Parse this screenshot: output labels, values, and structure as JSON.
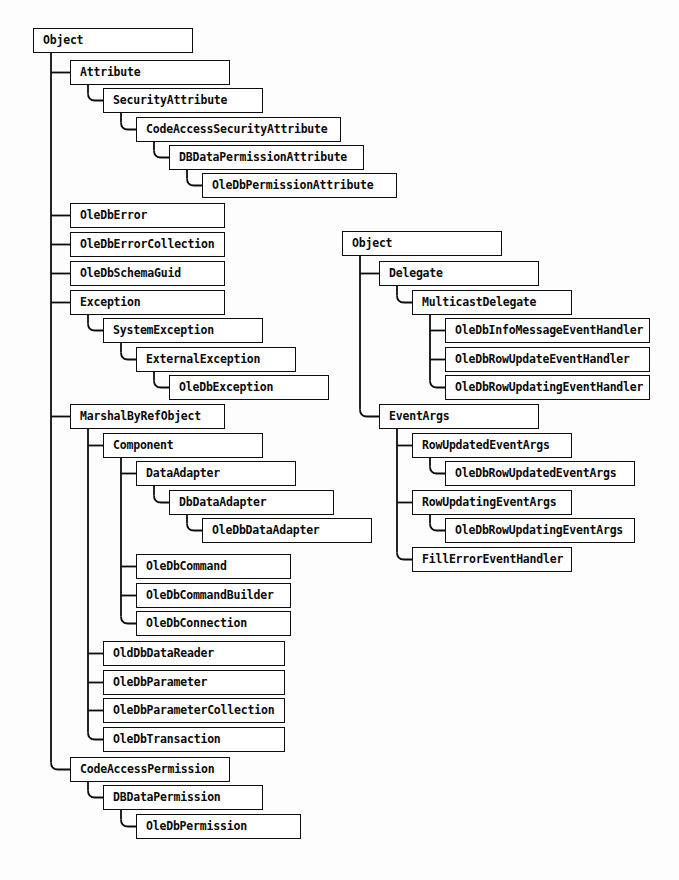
{
  "diagram": {
    "type": "class-hierarchy-tree",
    "background_color": "#fdfdfd",
    "box_border_color": "#0d0d0d",
    "box_fill_color": "#ffffff",
    "line_color": "#0d0d0d",
    "trees": [
      {
        "name": "object-tree-left",
        "root": "Object",
        "nodes": [
          {
            "id": "n0",
            "label": "Object",
            "level": 0,
            "x": 33,
            "y": 28,
            "w": 160,
            "parent": null
          },
          {
            "id": "n1",
            "label": "Attribute",
            "level": 1,
            "x": 70,
            "y": 60,
            "w": 160,
            "parent": "n0"
          },
          {
            "id": "n2",
            "label": "SecurityAttribute",
            "level": 2,
            "x": 103,
            "y": 88,
            "w": 160,
            "parent": "n1"
          },
          {
            "id": "n3",
            "label": "CodeAccessSecurityAttribute",
            "level": 3,
            "x": 136,
            "y": 117,
            "w": 205,
            "parent": "n2"
          },
          {
            "id": "n4",
            "label": "DBDataPermissionAttribute",
            "level": 4,
            "x": 169,
            "y": 145,
            "w": 195,
            "parent": "n3"
          },
          {
            "id": "n5",
            "label": "OleDbPermissionAttribute",
            "level": 5,
            "x": 202,
            "y": 173,
            "w": 195,
            "parent": "n4"
          },
          {
            "id": "n6",
            "label": "OleDbError",
            "level": 1,
            "x": 70,
            "y": 203,
            "w": 155,
            "parent": "n0"
          },
          {
            "id": "n7",
            "label": "OleDbErrorCollection",
            "level": 1,
            "x": 70,
            "y": 232,
            "w": 155,
            "parent": "n0"
          },
          {
            "id": "n8",
            "label": "OleDbSchemaGuid",
            "level": 1,
            "x": 70,
            "y": 261,
            "w": 155,
            "parent": "n0"
          },
          {
            "id": "n9",
            "label": "Exception",
            "level": 1,
            "x": 70,
            "y": 290,
            "w": 155,
            "parent": "n0"
          },
          {
            "id": "n10",
            "label": "SystemException",
            "level": 2,
            "x": 103,
            "y": 318,
            "w": 160,
            "parent": "n9"
          },
          {
            "id": "n11",
            "label": "ExternalException",
            "level": 3,
            "x": 136,
            "y": 347,
            "w": 160,
            "parent": "n10"
          },
          {
            "id": "n12",
            "label": "OleDbException",
            "level": 4,
            "x": 169,
            "y": 375,
            "w": 160,
            "parent": "n11"
          },
          {
            "id": "n13",
            "label": "MarshalByRefObject",
            "level": 1,
            "x": 70,
            "y": 404,
            "w": 155,
            "parent": "n0"
          },
          {
            "id": "n14",
            "label": "Component",
            "level": 2,
            "x": 103,
            "y": 433,
            "w": 160,
            "parent": "n13"
          },
          {
            "id": "n15",
            "label": "DataAdapter",
            "level": 3,
            "x": 136,
            "y": 461,
            "w": 160,
            "parent": "n14"
          },
          {
            "id": "n16",
            "label": "DbDataAdapter",
            "level": 4,
            "x": 169,
            "y": 490,
            "w": 165,
            "parent": "n15"
          },
          {
            "id": "n17",
            "label": "OleDbDataAdapter",
            "level": 5,
            "x": 202,
            "y": 518,
            "w": 170,
            "parent": "n16"
          },
          {
            "id": "n18",
            "label": "OleDbCommand",
            "level": 3,
            "x": 136,
            "y": 554,
            "w": 155,
            "parent": "n14"
          },
          {
            "id": "n19",
            "label": "OleDbCommandBuilder",
            "level": 3,
            "x": 136,
            "y": 583,
            "w": 155,
            "parent": "n14"
          },
          {
            "id": "n20",
            "label": "OleDbConnection",
            "level": 3,
            "x": 136,
            "y": 611,
            "w": 155,
            "parent": "n14"
          },
          {
            "id": "n21",
            "label": "OldDbDataReader",
            "level": 2,
            "x": 103,
            "y": 641,
            "w": 182,
            "parent": "n13"
          },
          {
            "id": "n22",
            "label": "OleDbParameter",
            "level": 2,
            "x": 103,
            "y": 670,
            "w": 182,
            "parent": "n13"
          },
          {
            "id": "n23",
            "label": "OleDbParameterCollection",
            "level": 2,
            "x": 103,
            "y": 698,
            "w": 182,
            "parent": "n13"
          },
          {
            "id": "n24",
            "label": "OleDbTransaction",
            "level": 2,
            "x": 103,
            "y": 727,
            "w": 182,
            "parent": "n13"
          },
          {
            "id": "n25",
            "label": "CodeAccessPermission",
            "level": 1,
            "x": 70,
            "y": 757,
            "w": 160,
            "parent": "n0"
          },
          {
            "id": "n26",
            "label": "DBDataPermission",
            "level": 2,
            "x": 103,
            "y": 785,
            "w": 160,
            "parent": "n25"
          },
          {
            "id": "n27",
            "label": "OleDbPermission",
            "level": 3,
            "x": 136,
            "y": 814,
            "w": 165,
            "parent": "n26"
          }
        ]
      },
      {
        "name": "object-tree-right",
        "root": "Object",
        "nodes": [
          {
            "id": "m0",
            "label": "Object",
            "level": 0,
            "x": 342,
            "y": 231,
            "w": 160,
            "parent": null
          },
          {
            "id": "m1",
            "label": "Delegate",
            "level": 1,
            "x": 379,
            "y": 261,
            "w": 160,
            "parent": "m0"
          },
          {
            "id": "m2",
            "label": "MulticastDelegate",
            "level": 2,
            "x": 412,
            "y": 290,
            "w": 160,
            "parent": "m1"
          },
          {
            "id": "m3",
            "label": "OleDbInfoMessageEventHandler",
            "level": 3,
            "x": 445,
            "y": 318,
            "w": 205,
            "parent": "m2"
          },
          {
            "id": "m4",
            "label": "OleDbRowUpdateEventHandler",
            "level": 3,
            "x": 445,
            "y": 347,
            "w": 205,
            "parent": "m2"
          },
          {
            "id": "m5",
            "label": "OleDbRowUpdatingEventHandler",
            "level": 3,
            "x": 445,
            "y": 375,
            "w": 205,
            "parent": "m2"
          },
          {
            "id": "m6",
            "label": "EventArgs",
            "level": 1,
            "x": 379,
            "y": 404,
            "w": 160,
            "parent": "m0"
          },
          {
            "id": "m7",
            "label": "RowUpdatedEventArgs",
            "level": 2,
            "x": 412,
            "y": 433,
            "w": 160,
            "parent": "m6"
          },
          {
            "id": "m8",
            "label": "OleDbRowUpdatedEventArgs",
            "level": 3,
            "x": 445,
            "y": 461,
            "w": 190,
            "parent": "m7"
          },
          {
            "id": "m9",
            "label": "RowUpdatingEventArgs",
            "level": 2,
            "x": 412,
            "y": 490,
            "w": 160,
            "parent": "m6"
          },
          {
            "id": "m10",
            "label": "OleDbRowUpdatingEventArgs",
            "level": 3,
            "x": 445,
            "y": 518,
            "w": 190,
            "parent": "m9"
          },
          {
            "id": "m11",
            "label": "FillErrorEventHandler",
            "level": 2,
            "x": 412,
            "y": 547,
            "w": 160,
            "parent": "m6"
          }
        ]
      }
    ]
  }
}
